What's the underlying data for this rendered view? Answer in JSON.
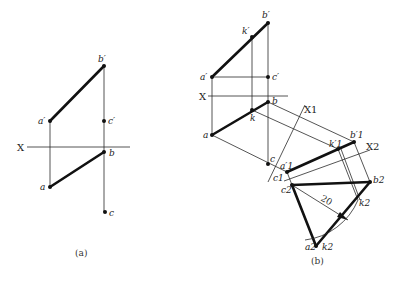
{
  "figure_a": {
    "caption": "(a)",
    "axis_label": "X",
    "labels": {
      "b_prime": "b′",
      "a_prime": "a′",
      "c_prime": "c′",
      "b": "b",
      "a": "a",
      "c": "c"
    }
  },
  "figure_b": {
    "caption": "(b)",
    "axis_label": "X",
    "axis_x1": "X1",
    "axis_x2": "X2",
    "dimension": "20",
    "labels": {
      "b_prime": "b′",
      "k_prime": "k′",
      "a_prime": "a′",
      "c_prime": "c′",
      "b": "b",
      "k": "k",
      "a": "a",
      "c": "c",
      "a1_prime": "a′1",
      "c1": "c1",
      "k1_prime": "k′1",
      "b1_prime": "b′1",
      "c2": "c2",
      "b2": "b2",
      "k2_right": "k2",
      "a2": "a2",
      "k2_bottom": "k2"
    }
  }
}
